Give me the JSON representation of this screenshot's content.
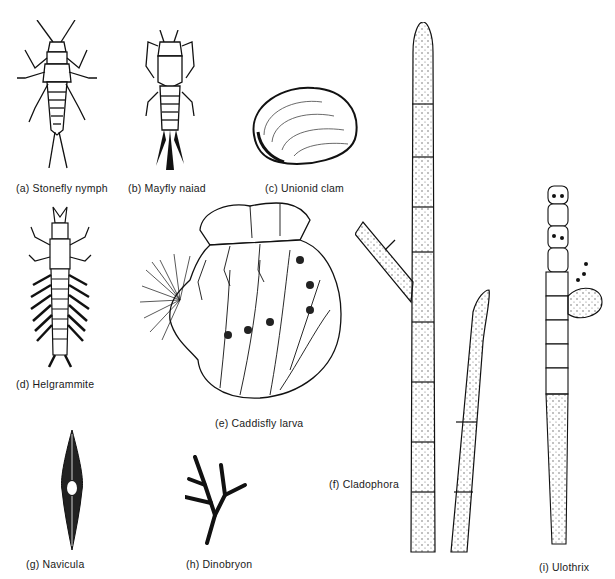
{
  "figure": {
    "panels": [
      {
        "id": "a",
        "label": "(a)  Stonefly nymph",
        "icon": "stonefly-nymph-icon"
      },
      {
        "id": "b",
        "label": "(b)  Mayfly naiad",
        "icon": "mayfly-naiad-icon"
      },
      {
        "id": "c",
        "label": "(c)  Unionid clam",
        "icon": "unionid-clam-icon"
      },
      {
        "id": "d",
        "label": "(d)  Helgrammite",
        "icon": "helgrammite-icon"
      },
      {
        "id": "e",
        "label": "(e)  Caddisfly larva",
        "icon": "caddisfly-larva-icon"
      },
      {
        "id": "f",
        "label": "(f)  Cladophora",
        "icon": "cladophora-icon"
      },
      {
        "id": "g",
        "label": "(g)  Navicula",
        "icon": "navicula-icon"
      },
      {
        "id": "h",
        "label": "(h)  Dinobryon",
        "icon": "dinobryon-icon"
      },
      {
        "id": "i",
        "label": "(i)  Ulothrix",
        "icon": "ulothrix-icon"
      }
    ]
  }
}
